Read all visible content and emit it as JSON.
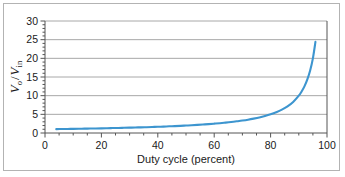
{
  "figure": {
    "background_color": "#ffffff",
    "border_color": "#b3b3b3"
  },
  "chart_data": {
    "type": "line",
    "title": "",
    "subtitle": "",
    "xlabel": "Duty cycle (percent)",
    "ylabel": "Vo / Vin",
    "ylabel_parts": {
      "v1": "V",
      "sub1": "o",
      "slash": "/",
      "v2": "V",
      "sub2": "in"
    },
    "xlim": [
      0,
      100
    ],
    "ylim": [
      0,
      30
    ],
    "xticks": [
      0,
      20,
      40,
      60,
      80,
      100
    ],
    "xtick_labels": [
      "0",
      "20",
      "40",
      "60",
      "80",
      "100"
    ],
    "xminor_step": 5,
    "yticks": [
      0,
      5,
      10,
      15,
      20,
      25,
      30
    ],
    "ytick_labels": [
      "0",
      "5",
      "10",
      "15",
      "20",
      "25",
      "30"
    ],
    "yminor_step": 1,
    "grid": true,
    "grid_axis": "y",
    "grid_color": "#a8a8a8",
    "axis_color": "#555555",
    "legend": false,
    "legend_position": "none",
    "series": [
      {
        "name": "Vo/Vin = 1/(1-D)",
        "color": "#3d95cf",
        "line_width": 2.1,
        "x": [
          4,
          6,
          8,
          10,
          12,
          14,
          16,
          18,
          20,
          22,
          24,
          26,
          28,
          30,
          32,
          34,
          36,
          38,
          40,
          42,
          44,
          46,
          48,
          50,
          52,
          54,
          56,
          58,
          60,
          62,
          64,
          66,
          68,
          70,
          72,
          74,
          76,
          78,
          80,
          82,
          84,
          86,
          88,
          90,
          91,
          92,
          93,
          94,
          95,
          95.9
        ],
        "values": [
          1.04,
          1.06,
          1.09,
          1.11,
          1.14,
          1.16,
          1.19,
          1.22,
          1.25,
          1.28,
          1.32,
          1.35,
          1.39,
          1.43,
          1.47,
          1.52,
          1.56,
          1.61,
          1.67,
          1.72,
          1.79,
          1.85,
          1.92,
          2.0,
          2.08,
          2.17,
          2.27,
          2.38,
          2.5,
          2.63,
          2.78,
          2.94,
          3.13,
          3.33,
          3.57,
          3.85,
          4.17,
          4.55,
          5.0,
          5.56,
          6.25,
          7.14,
          8.33,
          10.0,
          11.11,
          12.5,
          14.29,
          16.67,
          20.0,
          24.4
        ]
      }
    ]
  }
}
